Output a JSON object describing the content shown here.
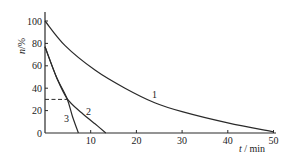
{
  "chart_data": {
    "type": "line",
    "title": "",
    "xlabel": "t / min",
    "ylabel": "n/%",
    "xlim": [
      0,
      50
    ],
    "ylim": [
      0,
      100
    ],
    "grid": false,
    "legend": "inline curve labels",
    "x_ticks": [
      10,
      20,
      30,
      40,
      50
    ],
    "y_ticks": [
      0,
      20,
      40,
      60,
      80,
      100
    ],
    "x_tick_labels": [
      "10",
      "20",
      "30",
      "40",
      "50"
    ],
    "y_tick_labels": [
      "0",
      "20",
      "40",
      "60",
      "80",
      "100"
    ],
    "series": [
      {
        "name": "1",
        "x": [
          0,
          4.4,
          11,
          17.5,
          24,
          30,
          40,
          50
        ],
        "values": [
          100,
          78,
          56,
          40,
          27,
          19,
          9,
          1
        ]
      },
      {
        "name": "2",
        "x": [
          0,
          2.5,
          4.8,
          8,
          11,
          13.3
        ],
        "values": [
          77,
          50,
          31,
          18,
          8,
          0
        ]
      },
      {
        "name": "3",
        "x": [
          0,
          2.5,
          4.8,
          6,
          7.3
        ],
        "values": [
          77,
          50,
          31,
          15,
          0
        ]
      }
    ],
    "annotations": [
      {
        "type": "dashed-hline",
        "y": 30,
        "x_from": 0,
        "x_to": 4.8
      }
    ]
  }
}
